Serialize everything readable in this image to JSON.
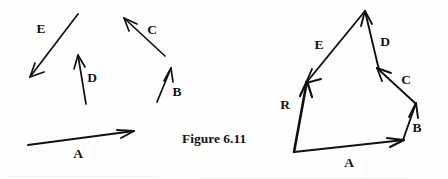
{
  "figure": {
    "caption": "Figure 6.11",
    "ink_color": "#111111",
    "background_color": "#fefefe",
    "width": 448,
    "height": 179
  },
  "left_panel": {
    "name": "given-vectors",
    "description": "Five separate vectors shown in isolation",
    "vectors": [
      {
        "id": "A",
        "label": "A",
        "tail": [
          28,
          145
        ],
        "head": [
          134,
          131
        ],
        "label_pos": [
          78,
          155
        ],
        "stroke_width": 1.9
      },
      {
        "id": "B",
        "label": "B",
        "tail": [
          157,
          102
        ],
        "head": [
          171,
          68
        ],
        "label_pos": [
          177,
          93
        ],
        "stroke_width": 1.7
      },
      {
        "id": "C",
        "label": "C",
        "tail": [
          165,
          56
        ],
        "head": [
          124,
          18
        ],
        "label_pos": [
          152,
          31
        ],
        "stroke_width": 1.7
      },
      {
        "id": "D",
        "label": "D",
        "tail": [
          86,
          104
        ],
        "head": [
          78,
          55
        ],
        "label_pos": [
          92,
          79
        ],
        "stroke_width": 1.7
      },
      {
        "id": "E",
        "label": "E",
        "tail": [
          78,
          14
        ],
        "head": [
          30,
          77
        ],
        "label_pos": [
          41,
          30
        ],
        "stroke_width": 1.7
      }
    ]
  },
  "right_panel": {
    "name": "vector-polygon",
    "description": "Same vectors placed tip-to-tail with resultant R closing the polygon",
    "origin": [
      294,
      152
    ],
    "apex": [
      365,
      11
    ],
    "vectors": [
      {
        "id": "A",
        "label": "A",
        "tail": [
          294,
          152
        ],
        "head": [
          404,
          140
        ],
        "label_pos": [
          349,
          164
        ],
        "stroke_width": 2.0
      },
      {
        "id": "B",
        "label": "B",
        "tail": [
          403,
          140
        ],
        "head": [
          416,
          103
        ],
        "label_pos": [
          417,
          129
        ],
        "stroke_width": 1.9
      },
      {
        "id": "C",
        "label": "C",
        "tail": [
          415,
          103
        ],
        "head": [
          377,
          68
        ],
        "label_pos": [
          406,
          81
        ],
        "stroke_width": 1.9
      },
      {
        "id": "D",
        "label": "D",
        "tail": [
          379,
          70
        ],
        "head": [
          365,
          11
        ],
        "label_pos": [
          385,
          43
        ],
        "stroke_width": 1.9
      },
      {
        "id": "E",
        "label": "E",
        "tail": [
          365,
          11
        ],
        "head": [
          306,
          83
        ],
        "label_pos": [
          319,
          46
        ],
        "stroke_width": 1.9
      },
      {
        "id": "R",
        "label": "R",
        "tail": [
          294,
          152
        ],
        "head": [
          307,
          81
        ],
        "label_pos": [
          285,
          106
        ],
        "stroke_width": 2.6
      }
    ]
  },
  "caption_pos": [
    182,
    140
  ]
}
